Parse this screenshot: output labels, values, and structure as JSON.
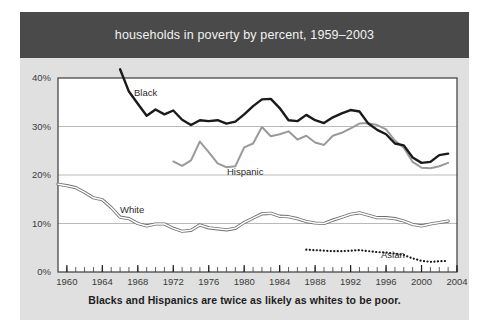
{
  "banner": {
    "title": "households in poverty by percent, 1959–2003",
    "background_color": "#4a4a4a",
    "text_color": "#f2f2f2"
  },
  "caption": {
    "text": "Blacks and Hispanics are twice as likely as whites to be poor."
  },
  "panel": {
    "background_color": "#e0e0e0",
    "page_background_color": "#ffffff"
  },
  "chart_data": {
    "type": "line",
    "title": "households in poverty by percent, 1959–2003",
    "subtitle": "Blacks and Hispanics are twice as likely as whites to be poor.",
    "xlabel": "",
    "ylabel": "",
    "xlim": [
      1959,
      2004
    ],
    "ylim": [
      0,
      40
    ],
    "grid": "horizontal",
    "legend": "inline-labels",
    "yticks": [
      0,
      10,
      20,
      30,
      40
    ],
    "ytick_labels": [
      "0%",
      "10%",
      "20%",
      "30%",
      "40%"
    ],
    "xticks": [
      1960,
      1964,
      1968,
      1972,
      1976,
      1980,
      1984,
      1988,
      1992,
      1996,
      2000,
      2004
    ],
    "xtick_labels": [
      "1960",
      "1964",
      "1968",
      "1972",
      "1976",
      "1980",
      "1984",
      "1988",
      "1992",
      "1996",
      "2000",
      "2004"
    ],
    "minor_xtick_interval": 1,
    "series": [
      {
        "name": "Black",
        "label": "Black",
        "color": "#1a1a1a",
        "style": "solid-thick",
        "x": [
          1966,
          1967,
          1968,
          1969,
          1970,
          1971,
          1972,
          1973,
          1974,
          1975,
          1976,
          1977,
          1978,
          1979,
          1980,
          1981,
          1982,
          1983,
          1984,
          1985,
          1986,
          1987,
          1988,
          1989,
          1990,
          1991,
          1992,
          1993,
          1994,
          1995,
          1996,
          1997,
          1998,
          1999,
          2000,
          2001,
          2002,
          2003
        ],
        "values": [
          41.8,
          37.2,
          34.7,
          32.2,
          33.5,
          32.5,
          33.3,
          31.4,
          30.3,
          31.3,
          31.1,
          31.3,
          30.6,
          31.0,
          32.5,
          34.2,
          35.6,
          35.7,
          33.8,
          31.3,
          31.1,
          32.4,
          31.3,
          30.7,
          31.9,
          32.7,
          33.4,
          33.1,
          30.6,
          29.3,
          28.4,
          26.5,
          26.1,
          23.6,
          22.5,
          22.7,
          24.1,
          24.4
        ]
      },
      {
        "name": "Hispanic",
        "label": "Hispanic",
        "color": "#9a9a9a",
        "style": "solid-medium",
        "x": [
          1972,
          1973,
          1974,
          1975,
          1976,
          1977,
          1978,
          1979,
          1980,
          1981,
          1982,
          1983,
          1984,
          1985,
          1986,
          1987,
          1988,
          1989,
          1990,
          1991,
          1992,
          1993,
          1994,
          1995,
          1996,
          1997,
          1998,
          1999,
          2000,
          2001,
          2002,
          2003
        ],
        "values": [
          22.8,
          21.9,
          23.0,
          26.9,
          24.7,
          22.4,
          21.6,
          21.8,
          25.7,
          26.5,
          29.9,
          28.0,
          28.4,
          29.0,
          27.3,
          28.1,
          26.7,
          26.2,
          28.1,
          28.7,
          29.6,
          30.6,
          30.7,
          30.3,
          29.4,
          27.1,
          25.6,
          22.7,
          21.5,
          21.4,
          21.8,
          22.5
        ]
      },
      {
        "name": "White",
        "label": "White",
        "color": "#6f6f6f",
        "style": "thin-outline",
        "x": [
          1959,
          1960,
          1961,
          1962,
          1963,
          1964,
          1965,
          1966,
          1967,
          1968,
          1969,
          1970,
          1971,
          1972,
          1973,
          1974,
          1975,
          1976,
          1977,
          1978,
          1979,
          1980,
          1981,
          1982,
          1983,
          1984,
          1985,
          1986,
          1987,
          1988,
          1989,
          1990,
          1991,
          1992,
          1993,
          1994,
          1995,
          1996,
          1997,
          1998,
          1999,
          2000,
          2001,
          2002,
          2003
        ],
        "values": [
          18.1,
          17.8,
          17.4,
          16.4,
          15.3,
          14.9,
          13.3,
          11.3,
          11.0,
          10.0,
          9.5,
          9.9,
          9.9,
          9.0,
          8.4,
          8.6,
          9.7,
          9.1,
          8.9,
          8.7,
          9.0,
          10.2,
          11.1,
          12.0,
          12.1,
          11.5,
          11.4,
          11.0,
          10.4,
          10.1,
          10.0,
          10.7,
          11.3,
          11.9,
          12.2,
          11.7,
          11.2,
          11.2,
          11.0,
          10.5,
          9.8,
          9.5,
          9.9,
          10.2,
          10.5
        ]
      },
      {
        "name": "Asian",
        "label": "Asian",
        "color": "#1a1a1a",
        "style": "dotted",
        "x": [
          1987,
          1988,
          1989,
          1990,
          1991,
          1992,
          1993,
          1994,
          1995,
          1996,
          1997,
          1998,
          1999,
          2000,
          2001,
          2002,
          2003
        ],
        "values": [
          4.6,
          4.5,
          4.4,
          4.3,
          4.3,
          4.4,
          4.5,
          4.3,
          4.1,
          4.0,
          3.8,
          3.5,
          2.8,
          2.3,
          2.1,
          2.2,
          2.3
        ]
      }
    ]
  }
}
